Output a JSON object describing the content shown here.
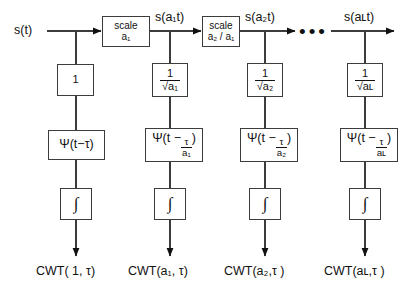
{
  "figure": {
    "source_label": "s(t)",
    "ellipsis": "•••"
  },
  "columns": [
    {
      "id": "col-1",
      "signal_label": "",
      "scale_box": null,
      "gain_label": "1",
      "wavelet_label": "Ψ(t−τ)",
      "integral_label": "∫",
      "output_label": "CWT( 1, τ)"
    },
    {
      "id": "col-2",
      "signal_label": "s(a₁t)",
      "scale_box": {
        "line1": "scale",
        "line2": "a₁"
      },
      "gain_label": "1/√a₁",
      "gain_num": "1",
      "gain_den_radicand": "a₁",
      "wavelet_label": "Ψ(t − τ/a₁)",
      "wavelet_prefix": "Ψ(t −",
      "wavelet_num": "τ",
      "wavelet_den": "a₁",
      "wavelet_suffix": ")",
      "integral_label": "∫",
      "output_label": "CWT(a₁, τ)"
    },
    {
      "id": "col-3",
      "signal_label": "s(a₂t)",
      "scale_box": {
        "line1": "scale",
        "line2": "a₂ / a₁"
      },
      "gain_label": "1/√a₂",
      "gain_num": "1",
      "gain_den_radicand": "a₂",
      "wavelet_label": "Ψ(t − τ/a₂)",
      "wavelet_prefix": "Ψ(t −",
      "wavelet_num": "τ",
      "wavelet_den": "a₂",
      "wavelet_suffix": ")",
      "integral_label": "∫",
      "output_label": "CWT(a₂,τ )"
    },
    {
      "id": "col-4",
      "signal_label": "s(aʟt)",
      "scale_box": null,
      "gain_label": "1/√aʟ",
      "gain_num": "1",
      "gain_den_radicand": "aʟ",
      "wavelet_label": "Ψ(t − τ/aʟ)",
      "wavelet_prefix": "Ψ(t −",
      "wavelet_num": "τ",
      "wavelet_den": "aʟ",
      "wavelet_suffix": ")",
      "integral_label": "∫",
      "output_label": "CWT(aʟ,τ )"
    }
  ],
  "style": {
    "line_color": "#3c3c3c",
    "text_color": "#111111",
    "background": "#ffffff"
  }
}
